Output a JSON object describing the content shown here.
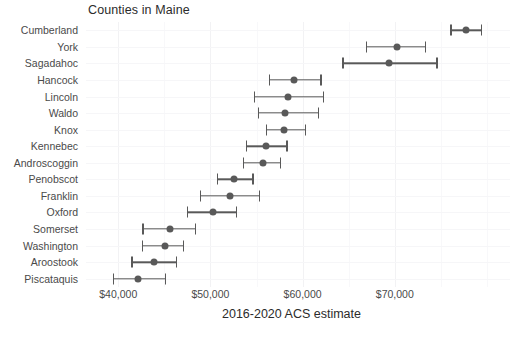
{
  "chart_data": {
    "type": "scatter",
    "title": "Counties in Maine",
    "xlabel": "2016-2020 ACS estimate",
    "ylabel": "",
    "orientation": "horizontal",
    "grid": true,
    "legend": false,
    "xlim": [
      36500,
      82500
    ],
    "xticks": [
      40000,
      50000,
      60000,
      70000
    ],
    "xticklabels": [
      "$40,000",
      "$50,000",
      "$60,000",
      "$70,000"
    ],
    "categories": [
      "Cumberland",
      "York",
      "Sagadahoc",
      "Hancock",
      "Lincoln",
      "Waldo",
      "Knox",
      "Kennebec",
      "Androscoggin",
      "Penobscot",
      "Franklin",
      "Oxford",
      "Somerset",
      "Washington",
      "Aroostook",
      "Piscataquis"
    ],
    "values": [
      77700,
      70200,
      69400,
      59100,
      58400,
      58100,
      58000,
      56000,
      55700,
      52600,
      52100,
      50300,
      45600,
      45100,
      43900,
      42100
    ],
    "error_low": [
      76100,
      66900,
      64400,
      56400,
      54800,
      55200,
      56100,
      53900,
      53600,
      50800,
      48900,
      47500,
      42700,
      42600,
      41500,
      39500
    ],
    "error_high": [
      79400,
      73300,
      74600,
      62000,
      62300,
      61700,
      60300,
      58300,
      57600,
      54600,
      55300,
      52800,
      48400,
      47100,
      46300,
      45100
    ],
    "marker_color": "#595959",
    "errorbar_color": "#595959",
    "points": [
      {
        "label": "Cumberland",
        "value": 77700,
        "low": 76100,
        "high": 79400
      },
      {
        "label": "York",
        "value": 70200,
        "low": 66900,
        "high": 73300
      },
      {
        "label": "Sagadahoc",
        "value": 69400,
        "low": 64400,
        "high": 74600
      },
      {
        "label": "Hancock",
        "value": 59100,
        "low": 56400,
        "high": 62000
      },
      {
        "label": "Lincoln",
        "value": 58400,
        "low": 54800,
        "high": 62300
      },
      {
        "label": "Waldo",
        "value": 58100,
        "low": 55200,
        "high": 61700
      },
      {
        "label": "Knox",
        "value": 58000,
        "low": 56100,
        "high": 60300
      },
      {
        "label": "Kennebec",
        "value": 56000,
        "low": 53900,
        "high": 58300
      },
      {
        "label": "Androscoggin",
        "value": 55700,
        "low": 53600,
        "high": 57600
      },
      {
        "label": "Penobscot",
        "value": 52600,
        "low": 50800,
        "high": 54600
      },
      {
        "label": "Franklin",
        "value": 52100,
        "low": 48900,
        "high": 55300
      },
      {
        "label": "Oxford",
        "value": 50300,
        "low": 47500,
        "high": 52800
      },
      {
        "label": "Somerset",
        "value": 45600,
        "low": 42700,
        "high": 48400
      },
      {
        "label": "Washington",
        "value": 45100,
        "low": 42600,
        "high": 47100
      },
      {
        "label": "Aroostook",
        "value": 43900,
        "low": 41500,
        "high": 46300
      },
      {
        "label": "Piscataquis",
        "value": 42100,
        "low": 39500,
        "high": 45100
      }
    ]
  }
}
